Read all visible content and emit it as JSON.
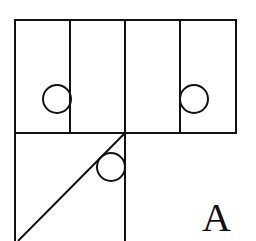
{
  "diagram": {
    "label": "A",
    "stroke_color": "#111111",
    "background": "#ffffff",
    "shapes": {
      "top_row_panels": 4,
      "circles": 3,
      "diagonal": 1
    }
  }
}
